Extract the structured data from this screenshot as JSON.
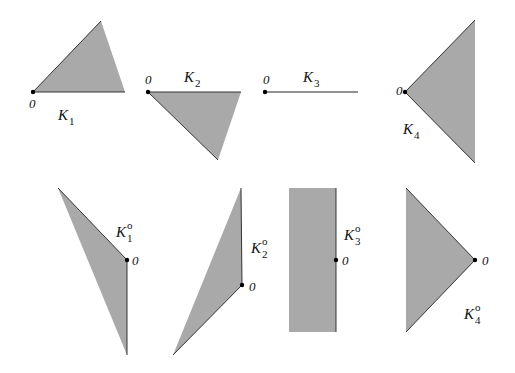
{
  "colors": {
    "fill": "#a9a9a9",
    "stroke": "#222222",
    "background": "#ffffff"
  },
  "origin_label": "0",
  "polar_superscript": "o",
  "cones": [
    {
      "id": "K1",
      "name": "K",
      "subscript": "1",
      "type": "cone",
      "points": [
        [
          33,
          92
        ],
        [
          101,
          21
        ],
        [
          125,
          92
        ]
      ],
      "origin": [
        33,
        92
      ],
      "origin_label_pos": [
        29,
        108
      ],
      "name_pos": [
        58,
        120
      ]
    },
    {
      "id": "K2",
      "name": "K",
      "subscript": "2",
      "type": "cone",
      "points": [
        [
          148,
          92
        ],
        [
          241,
          92
        ],
        [
          218,
          160
        ]
      ],
      "origin": [
        148,
        92
      ],
      "origin_label_pos": [
        145,
        84
      ],
      "name_pos": [
        184,
        82
      ]
    },
    {
      "id": "K3",
      "name": "K",
      "subscript": "3",
      "type": "ray",
      "points": [
        [
          265,
          92
        ],
        [
          358,
          92
        ]
      ],
      "origin": [
        265,
        92
      ],
      "origin_label_pos": [
        263,
        84
      ],
      "name_pos": [
        303,
        82
      ]
    },
    {
      "id": "K4",
      "name": "K",
      "subscript": "4",
      "type": "cone",
      "points": [
        [
          405,
          92
        ],
        [
          475,
          20
        ],
        [
          475,
          163
        ]
      ],
      "origin": [
        405,
        92
      ],
      "origin_label_pos": [
        396,
        95
      ],
      "name_pos": [
        403,
        134
      ]
    }
  ],
  "polars": [
    {
      "id": "K1polar",
      "name": "K",
      "subscript": "1",
      "points": [
        [
          58,
          188
        ],
        [
          127,
          260
        ],
        [
          127,
          355
        ]
      ],
      "origin": [
        127,
        260
      ],
      "origin_label_pos": [
        132,
        265
      ],
      "name_pos": [
        116,
        237
      ]
    },
    {
      "id": "K2polar",
      "name": "K",
      "subscript": "2",
      "points": [
        [
          241,
          188
        ],
        [
          242,
          285
        ],
        [
          173,
          355
        ]
      ],
      "origin": [
        242,
        285
      ],
      "origin_label_pos": [
        249,
        291
      ],
      "name_pos": [
        251,
        253
      ]
    },
    {
      "id": "K3polar",
      "name": "K",
      "subscript": "3",
      "points": [
        [
          289,
          188
        ],
        [
          336,
          188
        ],
        [
          336,
          332
        ],
        [
          289,
          332
        ]
      ],
      "origin": [
        336,
        260
      ],
      "origin_label_pos": [
        342,
        265
      ],
      "name_pos": [
        344,
        240
      ]
    },
    {
      "id": "K4polar",
      "name": "K",
      "subscript": "4",
      "points": [
        [
          406,
          188
        ],
        [
          475,
          260
        ],
        [
          406,
          332
        ]
      ],
      "origin": [
        475,
        260
      ],
      "origin_label_pos": [
        482,
        265
      ],
      "name_pos": [
        464,
        319
      ]
    }
  ]
}
